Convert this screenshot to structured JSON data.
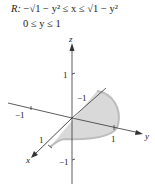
{
  "region": {
    "label": "R:",
    "x_bounds": "−√1 − y² ≤ x ≤ √1 − y²",
    "y_bounds": "0 ≤ y ≤ 1"
  },
  "axes": {
    "x_label": "x",
    "y_label": "y",
    "z_label": "z",
    "z_pos_tick": "1",
    "z_neg_tick": "−1",
    "y_neg_tick": "−1",
    "y_pos_tick": "1",
    "x_pos_tick": "1",
    "x_neg_tick": "−1"
  },
  "colors": {
    "fill": "#d9d9d9",
    "edge": "#b8b8b8",
    "axis": "#333333"
  }
}
